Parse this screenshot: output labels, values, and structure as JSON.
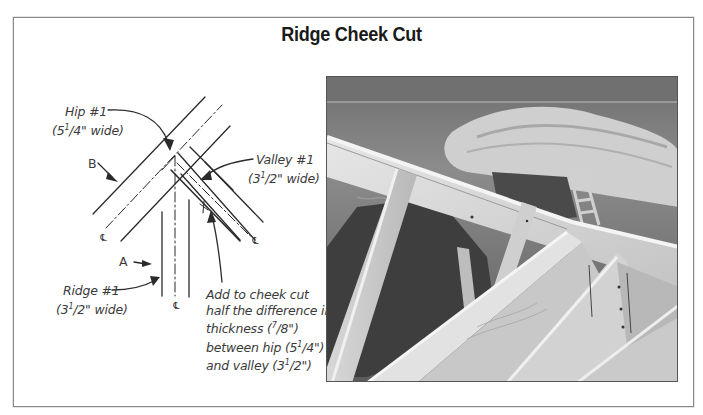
{
  "figure": {
    "title": "Ridge Cheek Cut"
  },
  "diagram": {
    "labels": {
      "hip": {
        "name": "Hip #1",
        "width_whole": "(5",
        "width_frac": "1",
        "width_rest": "/4\" wide)"
      },
      "valley": {
        "name": "Valley #1",
        "width_whole": "(3",
        "width_frac": "1",
        "width_rest": "/2\" wide)"
      },
      "ridge": {
        "name": "Ridge #1",
        "width_whole": "(3",
        "width_frac": "1",
        "width_rest": "/2\" wide)"
      },
      "point_a": "A",
      "point_b": "B",
      "centerline_symbol": "℄"
    },
    "note": {
      "lines": [
        "Add to cheek cut",
        "half the difference in",
        "thickness (7/8\")",
        "between hip (5 1/4\")",
        "and valley (3 1/2\")"
      ],
      "line3_pre": "thickness (",
      "line3_frac_num": "7",
      "line3_frac_den": "/8\")",
      "line4_pre": "between hip (5",
      "line4_frac_num": "1",
      "line4_frac_den": "/4\")",
      "line5_pre": "and valley (3",
      "line5_frac_num": "1",
      "line5_frac_den": "/2\")"
    }
  },
  "photo": {
    "description": "Roof framing photo showing ridge, hip and valley rafters meeting with cheek cuts"
  },
  "colors": {
    "line": "#2a2a2a",
    "text": "#3a3a3a",
    "frame": "#8a8a8a"
  }
}
